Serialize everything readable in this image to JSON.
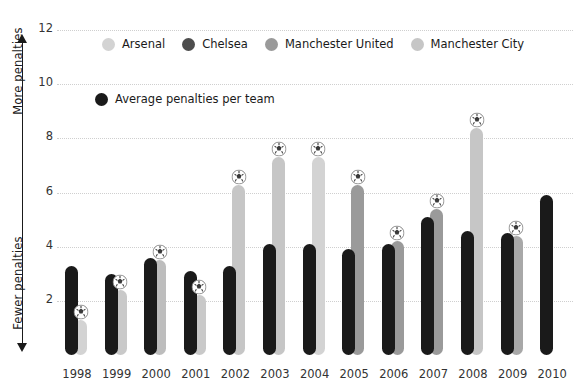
{
  "axis": {
    "top_caption": "More penalties",
    "bottom_caption": "Fewer penalties",
    "y_ticks": [
      "12",
      "10",
      "8",
      "6",
      "4",
      "2"
    ]
  },
  "legend_teams": [
    {
      "label": "Arsenal",
      "color": "#d3d3d3"
    },
    {
      "label": "Chelsea",
      "color": "#4d4d4d"
    },
    {
      "label": "Manchester United",
      "color": "#9a9a9a"
    },
    {
      "label": "Manchester City",
      "color": "#c6c6c6"
    }
  ],
  "legend_avg": {
    "label": "Average penalties per team",
    "color": "#1a1a1a"
  },
  "chart_data": {
    "type": "bar",
    "title": "",
    "xlabel": "",
    "ylabel": "",
    "ylim": [
      0,
      12.6
    ],
    "grid": true,
    "legend_position": "top",
    "categories": [
      "1998",
      "1999",
      "2000",
      "2001",
      "2002",
      "2003",
      "2004",
      "2005",
      "2006",
      "2007",
      "2008",
      "2009",
      "2010"
    ],
    "series": [
      {
        "name": "Average penalties per team",
        "color": "#1a1a1a",
        "values": [
          3.3,
          3.0,
          3.6,
          3.1,
          3.3,
          4.1,
          4.1,
          3.9,
          4.1,
          5.1,
          4.6,
          4.5,
          5.9
        ]
      },
      {
        "name": "Top penalty team",
        "marker": "football",
        "values": [
          1.3,
          2.4,
          3.5,
          2.2,
          6.3,
          7.3,
          7.3,
          6.3,
          4.2,
          5.4,
          8.4,
          4.4,
          null
        ],
        "colors": [
          "#d3d3d3",
          "#c9c9c9",
          "#bdbdbd",
          "#c9c9c9",
          "#c6c6c6",
          "#c6c6c6",
          "#d3d3d3",
          "#9a9a9a",
          "#9a9a9a",
          "#9a9a9a",
          "#c6c6c6",
          "#a8a8a8",
          null
        ]
      }
    ]
  }
}
